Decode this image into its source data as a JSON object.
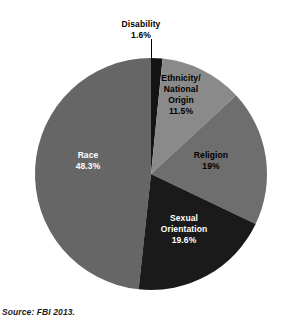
{
  "source_note": "Source: FBI 2013.",
  "labels": {
    "disability": {
      "name": "Disability",
      "value": "1.6%"
    },
    "ethnicity": {
      "name_line1": "Ethnicity/",
      "name_line2": "National",
      "name_line3": "Origin",
      "value": "11.5%"
    },
    "religion": {
      "name": "Religion",
      "value": "19%"
    },
    "sexual_orientation": {
      "name_line1": "Sexual",
      "name_line2": "Orientation",
      "value": "19.6%"
    },
    "race": {
      "name": "Race",
      "value": "48.3%"
    }
  },
  "colors": {
    "disability": "#141414",
    "ethnicity": "#8a8a8a",
    "religion": "#6e6e6e",
    "sexual_orientation": "#1a1a1a",
    "race": "#666666",
    "background": "#ffffff",
    "leader_line": "#000000"
  },
  "chart_data": {
    "type": "pie",
    "title": "",
    "subtitle": "",
    "xlabel": "",
    "ylabel": "",
    "grid": false,
    "legend_position": "none",
    "label_style": "inside-slice-with-callout",
    "start_angle_deg": 0,
    "direction": "clockwise",
    "total": "100%",
    "units": "percent",
    "center_px": [
      151,
      174
    ],
    "radius_px": 116,
    "slices": [
      {
        "category": "Disability",
        "value": 1.6,
        "label": "1.6%",
        "color": "#141414",
        "angle_deg": 5.8,
        "label_placement": "callout-top",
        "text_color": "#000000"
      },
      {
        "category": "Ethnicity/National Origin",
        "value": 11.5,
        "label": "11.5%",
        "color": "#8a8a8a",
        "angle_deg": 41.4,
        "label_placement": "inside",
        "text_color": "#000000"
      },
      {
        "category": "Religion",
        "value": 19,
        "label": "19%",
        "color": "#6e6e6e",
        "angle_deg": 68.4,
        "label_placement": "inside",
        "text_color": "#000000"
      },
      {
        "category": "Sexual Orientation",
        "value": 19.6,
        "label": "19.6%",
        "color": "#1a1a1a",
        "angle_deg": 70.6,
        "label_placement": "inside",
        "text_color": "#ffffff"
      },
      {
        "category": "Race",
        "value": 48.3,
        "label": "48.3%",
        "color": "#666666",
        "angle_deg": 173.9,
        "label_placement": "inside",
        "text_color": "#ffffff"
      }
    ],
    "categories": [
      "Disability",
      "Ethnicity/National Origin",
      "Religion",
      "Sexual Orientation",
      "Race"
    ],
    "values": [
      1.6,
      11.5,
      19,
      19.6,
      48.3
    ],
    "source": "Source: FBI 2013."
  }
}
